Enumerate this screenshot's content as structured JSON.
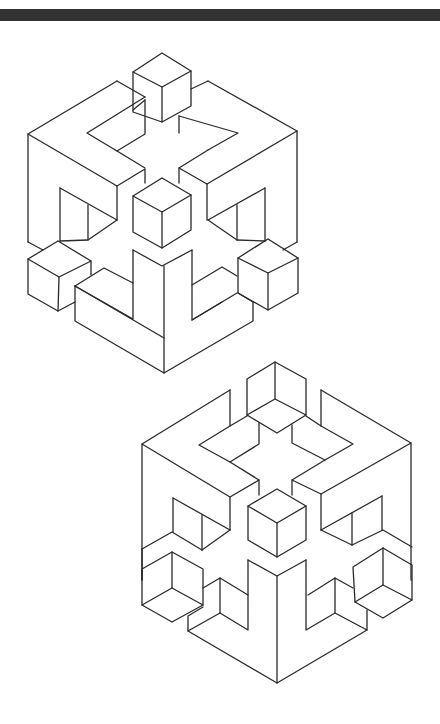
{
  "page": {
    "background": "#ffffff",
    "top_bar_color": "#333333",
    "line_color": "#2a2a2a"
  },
  "figures": [
    {
      "name": "impossible-cube-convex",
      "description": "Isometric open cube frame with convex corner cubes",
      "paths": [
        [
          [
            162,
            53
          ],
          [
            133,
            72
          ],
          [
            162,
            87
          ],
          [
            191,
            71
          ],
          [
            162,
            53
          ]
        ],
        [
          [
            133,
            72
          ],
          [
            133,
            112
          ],
          [
            162,
            122
          ]
        ],
        [
          [
            162,
            87
          ],
          [
            162,
            122
          ],
          [
            191,
            106
          ],
          [
            191,
            71
          ]
        ],
        [
          [
            117,
            81
          ],
          [
            28,
            134
          ],
          [
            28,
            242
          ]
        ],
        [
          [
            117,
            81
          ],
          [
            145,
            97
          ]
        ],
        [
          [
            133,
            110
          ],
          [
            145,
            100
          ]
        ],
        [
          [
            145,
            97
          ],
          [
            87,
            133
          ],
          [
            117,
            151
          ],
          [
            145,
            134
          ],
          [
            145,
            100
          ]
        ],
        [
          [
            28,
            134
          ],
          [
            117,
            186
          ],
          [
            145,
            169
          ],
          [
            145,
            183
          ]
        ],
        [
          [
            117,
            151
          ],
          [
            145,
            168
          ]
        ],
        [
          [
            117,
            186
          ],
          [
            117,
            220
          ]
        ],
        [
          [
            208,
            81
          ],
          [
            297,
            131
          ],
          [
            297,
            242
          ]
        ],
        [
          [
            191,
            89
          ],
          [
            208,
            81
          ]
        ],
        [
          [
            179,
            116
          ],
          [
            238,
            133
          ],
          [
            208,
            150
          ]
        ],
        [
          [
            179,
            116
          ],
          [
            179,
            133
          ]
        ],
        [
          [
            208,
            150
          ],
          [
            179,
            168
          ],
          [
            207,
            184
          ],
          [
            297,
            131
          ]
        ],
        [
          [
            179,
            168
          ],
          [
            179,
            183
          ]
        ],
        [
          [
            207,
            184
          ],
          [
            207,
            220
          ]
        ],
        [
          [
            162,
            178
          ],
          [
            133,
            196
          ],
          [
            162,
            212
          ],
          [
            191,
            195
          ],
          [
            162,
            178
          ]
        ],
        [
          [
            133,
            196
          ],
          [
            133,
            232
          ],
          [
            162,
            248
          ],
          [
            191,
            230
          ],
          [
            191,
            195
          ]
        ],
        [
          [
            162,
            212
          ],
          [
            162,
            248
          ]
        ],
        [
          [
            60,
            188
          ],
          [
            60,
            241
          ]
        ],
        [
          [
            60,
            188
          ],
          [
            117,
            220
          ]
        ],
        [
          [
            88,
            205
          ],
          [
            88,
            240
          ]
        ],
        [
          [
            117,
            220
          ],
          [
            88,
            240
          ],
          [
            60,
            241
          ]
        ],
        [
          [
            28,
            242
          ],
          [
            43,
            250
          ]
        ],
        [
          [
            265,
            188
          ],
          [
            265,
            241
          ]
        ],
        [
          [
            208,
            220
          ],
          [
            265,
            188
          ]
        ],
        [
          [
            237,
            205
          ],
          [
            237,
            240
          ]
        ],
        [
          [
            208,
            220
          ],
          [
            237,
            240
          ],
          [
            265,
            241
          ]
        ],
        [
          [
            297,
            242
          ],
          [
            283,
            250
          ]
        ],
        [
          [
            58,
            241
          ],
          [
            28,
            259
          ],
          [
            59,
            277
          ],
          [
            91,
            261
          ],
          [
            58,
            241
          ]
        ],
        [
          [
            28,
            259
          ],
          [
            28,
            294
          ],
          [
            58,
            311
          ],
          [
            75,
            302
          ]
        ],
        [
          [
            59,
            277
          ],
          [
            58,
            311
          ]
        ],
        [
          [
            91,
            261
          ],
          [
            91,
            275
          ]
        ],
        [
          [
            75,
            286
          ],
          [
            104,
            268
          ],
          [
            133,
            283
          ]
        ],
        [
          [
            75,
            286
          ],
          [
            75,
            321
          ],
          [
            164,
            373
          ],
          [
            253,
            321
          ],
          [
            253,
            302
          ]
        ],
        [
          [
            75,
            286
          ],
          [
            164,
            338
          ]
        ],
        [
          [
            133,
            250
          ],
          [
            133,
            319
          ],
          [
            75,
            286
          ]
        ],
        [
          [
            133,
            250
          ],
          [
            162,
            266
          ],
          [
            192,
            250
          ]
        ],
        [
          [
            164,
            266
          ],
          [
            164,
            373
          ]
        ],
        [
          [
            192,
            250
          ],
          [
            192,
            320
          ],
          [
            237,
            293
          ]
        ],
        [
          [
            192,
            320
          ],
          [
            222,
            302
          ]
        ],
        [
          [
            192,
            285
          ],
          [
            222,
            267
          ],
          [
            237,
            276
          ]
        ],
        [
          [
            268,
            239
          ],
          [
            238,
            258
          ],
          [
            268,
            273
          ],
          [
            298,
            258
          ],
          [
            268,
            239
          ]
        ],
        [
          [
            238,
            258
          ],
          [
            238,
            293
          ],
          [
            268,
            310
          ],
          [
            298,
            293
          ],
          [
            298,
            258
          ]
        ],
        [
          [
            268,
            273
          ],
          [
            268,
            310
          ]
        ],
        [
          [
            238,
            293
          ],
          [
            253,
            302
          ]
        ]
      ]
    },
    {
      "name": "impossible-cube-concave",
      "description": "Isometric open cube frame with concave (inverted) corner cubes",
      "paths": [
        [
          [
            275,
            362
          ],
          [
            247,
            379
          ],
          [
            247,
            415
          ],
          [
            277,
            433
          ],
          [
            306,
            415
          ],
          [
            306,
            379
          ],
          [
            275,
            362
          ]
        ],
        [
          [
            275,
            362
          ],
          [
            275,
            399
          ],
          [
            247,
            415
          ]
        ],
        [
          [
            275,
            399
          ],
          [
            306,
            415
          ]
        ],
        [
          [
            230,
            390
          ],
          [
            142,
            444
          ],
          [
            142,
            580
          ]
        ],
        [
          [
            230,
            390
          ],
          [
            230,
            426
          ],
          [
            247,
            416
          ]
        ],
        [
          [
            230,
            426
          ],
          [
            199,
            445
          ],
          [
            230,
            462
          ],
          [
            259,
            444
          ],
          [
            259,
            423
          ]
        ],
        [
          [
            142,
            444
          ],
          [
            230,
            497
          ],
          [
            259,
            480
          ],
          [
            259,
            495
          ]
        ],
        [
          [
            230,
            462
          ],
          [
            259,
            480
          ]
        ],
        [
          [
            230,
            497
          ],
          [
            230,
            530
          ]
        ],
        [
          [
            321,
            390
          ],
          [
            411,
            443
          ],
          [
            411,
            580
          ]
        ],
        [
          [
            321,
            390
          ],
          [
            321,
            426
          ],
          [
            306,
            416
          ]
        ],
        [
          [
            292,
            425
          ],
          [
            292,
            443
          ],
          [
            325,
            460
          ],
          [
            353,
            444
          ],
          [
            321,
            426
          ]
        ],
        [
          [
            325,
            460
          ],
          [
            292,
            480
          ],
          [
            321,
            494
          ],
          [
            411,
            443
          ]
        ],
        [
          [
            292,
            480
          ],
          [
            292,
            495
          ]
        ],
        [
          [
            321,
            494
          ],
          [
            321,
            530
          ]
        ],
        [
          [
            173,
            498
          ],
          [
            173,
            532
          ]
        ],
        [
          [
            173,
            498
          ],
          [
            230,
            530
          ]
        ],
        [
          [
            202,
            515
          ],
          [
            202,
            550
          ]
        ],
        [
          [
            230,
            530
          ],
          [
            202,
            550
          ]
        ],
        [
          [
            142,
            549
          ],
          [
            172,
            532
          ],
          [
            202,
            550
          ]
        ],
        [
          [
            142,
            580
          ],
          [
            142,
            549
          ]
        ],
        [
          [
            382,
            496
          ],
          [
            382,
            530
          ]
        ],
        [
          [
            321,
            530
          ],
          [
            382,
            496
          ]
        ],
        [
          [
            352,
            513
          ],
          [
            352,
            545
          ]
        ],
        [
          [
            321,
            530
          ],
          [
            352,
            545
          ]
        ],
        [
          [
            352,
            545
          ],
          [
            383,
            530
          ],
          [
            412,
            547
          ]
        ],
        [
          [
            277,
            489
          ],
          [
            248,
            506
          ],
          [
            277,
            523
          ],
          [
            306,
            506
          ],
          [
            277,
            489
          ]
        ],
        [
          [
            248,
            506
          ],
          [
            248,
            540
          ],
          [
            277,
            557
          ],
          [
            306,
            540
          ],
          [
            306,
            506
          ]
        ],
        [
          [
            277,
            523
          ],
          [
            277,
            557
          ]
        ],
        [
          [
            172,
            552
          ],
          [
            142,
            569
          ],
          [
            142,
            605
          ],
          [
            172,
            622
          ],
          [
            203,
            605
          ],
          [
            203,
            569
          ],
          [
            172,
            552
          ]
        ],
        [
          [
            172,
            552
          ],
          [
            172,
            588
          ],
          [
            142,
            605
          ]
        ],
        [
          [
            172,
            588
          ],
          [
            203,
            605
          ]
        ],
        [
          [
            383,
            548
          ],
          [
            353,
            567
          ],
          [
            355,
            602
          ],
          [
            383,
            618
          ],
          [
            412,
            600
          ],
          [
            412,
            565
          ],
          [
            383,
            548
          ]
        ],
        [
          [
            383,
            548
          ],
          [
            383,
            585
          ],
          [
            355,
            602
          ]
        ],
        [
          [
            383,
            585
          ],
          [
            412,
            600
          ]
        ],
        [
          [
            248,
            560
          ],
          [
            277,
            576
          ],
          [
            306,
            560
          ]
        ],
        [
          [
            277,
            576
          ],
          [
            277,
            683
          ]
        ],
        [
          [
            248,
            560
          ],
          [
            248,
            630
          ],
          [
            220,
            613
          ],
          [
            220,
            578
          ],
          [
            203,
            588
          ]
        ],
        [
          [
            248,
            595
          ],
          [
            220,
            578
          ]
        ],
        [
          [
            220,
            613
          ],
          [
            188,
            631
          ],
          [
            188,
            616
          ],
          [
            203,
            607
          ]
        ],
        [
          [
            188,
            631
          ],
          [
            277,
            683
          ],
          [
            367,
            630
          ],
          [
            367,
            610
          ]
        ],
        [
          [
            306,
            560
          ],
          [
            306,
            630
          ],
          [
            335,
            613
          ],
          [
            335,
            578
          ],
          [
            353,
            588
          ]
        ],
        [
          [
            308,
            595
          ],
          [
            335,
            578
          ]
        ],
        [
          [
            335,
            613
          ],
          [
            367,
            630
          ]
        ]
      ]
    }
  ]
}
